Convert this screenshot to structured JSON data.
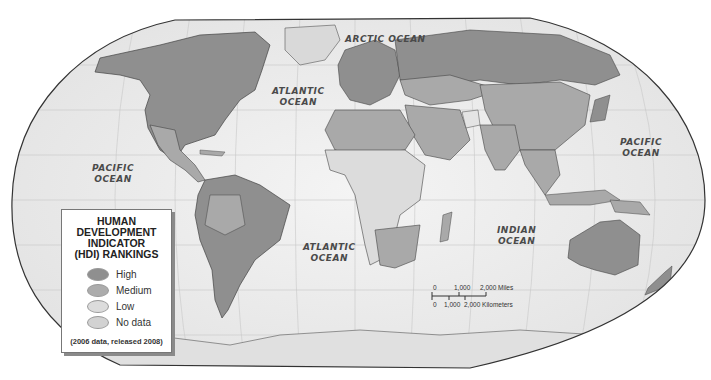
{
  "map": {
    "projection": "world-oval",
    "colors": {
      "ocean": "#ececec",
      "high": "#8f8f8f",
      "medium": "#a9a9a9",
      "low": "#d8d8d8",
      "no_data": "#d0d0d0",
      "border": "#444444"
    }
  },
  "ocean_labels": [
    {
      "name": "arctic",
      "line1": "ARCTIC OCEAN",
      "line2": ""
    },
    {
      "name": "atlantic-north",
      "line1": "ATLANTIC",
      "line2": "OCEAN"
    },
    {
      "name": "pacific-west",
      "line1": "PACIFIC",
      "line2": "OCEAN"
    },
    {
      "name": "pacific-east",
      "line1": "PACIFIC",
      "line2": "OCEAN"
    },
    {
      "name": "atlantic-south",
      "line1": "ATLANTIC",
      "line2": "OCEAN"
    },
    {
      "name": "indian",
      "line1": "INDIAN",
      "line2": "OCEAN"
    }
  ],
  "legend": {
    "title_lines": [
      "HUMAN",
      "DEVELOPMENT",
      "INDICATOR",
      "(HDI) RANKINGS"
    ],
    "items": [
      {
        "label": "High",
        "color": "#8f8f8f"
      },
      {
        "label": "Medium",
        "color": "#acacac"
      },
      {
        "label": "Low",
        "color": "#dcdcdc"
      },
      {
        "label": "No data",
        "color": "#d2d2d2"
      }
    ],
    "note": "(2006 data, released 2008)"
  },
  "scale_bar": {
    "miles_ticks": [
      "0",
      "1,000",
      "2,000 Miles"
    ],
    "km_ticks": [
      "0",
      "1,000",
      "2,000 Kilometers"
    ]
  }
}
